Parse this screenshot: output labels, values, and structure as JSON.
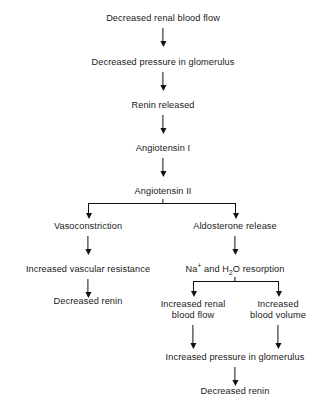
{
  "diagram": {
    "nodes": {
      "decreased_renal_blood_flow": "Decreased renal blood flow",
      "decreased_pressure_glomerulus": "Decreased pressure in glomerulus",
      "renin_released": "Renin released",
      "angiotensin_i": "Angiotensin I",
      "angiotensin_ii": "Angiotensin II",
      "vasoconstriction": "Vasoconstriction",
      "aldosterone_release": "Aldosterone release",
      "increased_vascular_resistance": "Increased vascular resistance",
      "decreased_renin_left": "Decreased renin",
      "na_h2o_resorption_prefix": "Na",
      "na_charge": "+",
      "na_h2o_resorption_mid": " and H",
      "h2o_subscript": "2",
      "na_h2o_resorption_suffix": "O resorption",
      "increased_renal_blood_flow_line1": "Increased renal",
      "increased_renal_blood_flow_line2": "blood flow",
      "increased_blood_volume_line1": "Increased",
      "increased_blood_volume_line2": "blood volume",
      "increased_pressure_glomerulus": "Increased pressure in glomerulus",
      "decreased_renin_right": "Decreased renin"
    },
    "colors": {
      "background": "#ffffff",
      "text": "#1a1a1a",
      "connector": "#111111"
    }
  }
}
